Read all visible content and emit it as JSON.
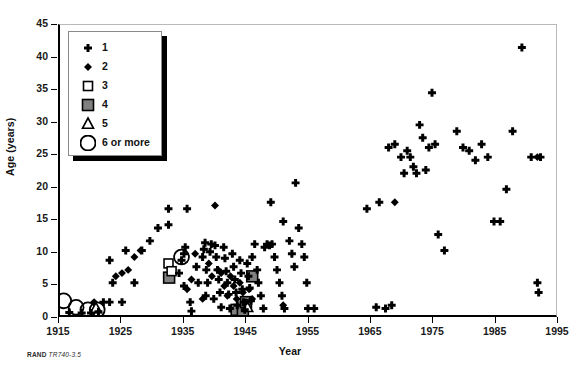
{
  "caption": {
    "brand": "RAND",
    "code": "TR740-3.5"
  },
  "legend": {
    "title": "",
    "items": [
      {
        "label": "1",
        "marker": "plus-icon"
      },
      {
        "label": "2",
        "marker": "filled-diamond-icon"
      },
      {
        "label": "3",
        "marker": "open-square-icon"
      },
      {
        "label": "4",
        "marker": "gray-square-icon"
      },
      {
        "label": "5",
        "marker": "open-triangle-icon"
      },
      {
        "label": "6 or more",
        "marker": "open-circle-icon"
      }
    ]
  },
  "colors": {
    "marker_black": "#000000",
    "gray_fill": "#808080",
    "axis": "#000000",
    "frame": "#b9b9b9",
    "background": "#ffffff"
  },
  "chart_data": {
    "type": "scatter",
    "title": "",
    "subtitle": "",
    "xlabel": "Year",
    "ylabel": "Age (years)",
    "xlim": [
      1915,
      1995
    ],
    "ylim": [
      0,
      45
    ],
    "xticks": [
      1915,
      1925,
      1935,
      1945,
      1955,
      1965,
      1975,
      1985,
      1995
    ],
    "yticks": [
      0,
      5,
      10,
      15,
      20,
      25,
      30,
      35,
      40,
      45
    ],
    "xtick_labels": [
      "1915",
      "1925",
      "1935",
      "1945",
      "1955",
      "1965",
      "1975",
      "1985",
      "1995"
    ],
    "ytick_labels": [
      "0",
      "5",
      "10",
      "15",
      "20",
      "25",
      "30",
      "35",
      "40",
      "45"
    ],
    "grid": false,
    "legend_position": "upper-left",
    "legend_title": "",
    "series": [
      {
        "name": "1",
        "marker": "plus",
        "count_represented": 1,
        "points": [
          [
            1916.5,
            0.4
          ],
          [
            1918.5,
            0.3
          ],
          [
            1920.0,
            0.3
          ],
          [
            1921.2,
            0.5
          ],
          [
            1922.0,
            2.0
          ],
          [
            1923.0,
            2.0
          ],
          [
            1925.0,
            2.0
          ],
          [
            1923.5,
            5.0
          ],
          [
            1927.0,
            5.0
          ],
          [
            1923.0,
            8.5
          ],
          [
            1925.6,
            10.0
          ],
          [
            1928.2,
            10.0
          ],
          [
            1929.5,
            11.5
          ],
          [
            1930.8,
            13.5
          ],
          [
            1932.5,
            16.5
          ],
          [
            1935.5,
            16.5
          ],
          [
            1932.5,
            14.0
          ],
          [
            1934.6,
            8.5
          ],
          [
            1935.0,
            9.5
          ],
          [
            1935.2,
            10.5
          ],
          [
            1934.2,
            6.5
          ],
          [
            1935.0,
            4.5
          ],
          [
            1936.0,
            2.0
          ],
          [
            1936.2,
            0.6
          ],
          [
            1937.0,
            7.5
          ],
          [
            1937.3,
            5.0
          ],
          [
            1938.0,
            9.0
          ],
          [
            1938.2,
            10.2
          ],
          [
            1938.4,
            11.2
          ],
          [
            1938.6,
            7.0
          ],
          [
            1938.8,
            5.0
          ],
          [
            1938.5,
            3.0
          ],
          [
            1939.2,
            9.8
          ],
          [
            1939.4,
            11.0
          ],
          [
            1939.8,
            2.5
          ],
          [
            1940.0,
            10.8
          ],
          [
            1940.2,
            9.0
          ],
          [
            1940.4,
            7.0
          ],
          [
            1940.6,
            5.5
          ],
          [
            1940.8,
            3.5
          ],
          [
            1941.0,
            1.2
          ],
          [
            1941.4,
            10.5
          ],
          [
            1941.6,
            8.8
          ],
          [
            1941.8,
            6.8
          ],
          [
            1942.0,
            5.0
          ],
          [
            1942.2,
            3.2
          ],
          [
            1942.4,
            1.0
          ],
          [
            1942.8,
            9.5
          ],
          [
            1943.0,
            7.5
          ],
          [
            1943.2,
            5.5
          ],
          [
            1943.4,
            3.5
          ],
          [
            1943.6,
            1.5
          ],
          [
            1944.0,
            8.5
          ],
          [
            1944.2,
            6.5
          ],
          [
            1944.4,
            4.0
          ],
          [
            1944.6,
            2.0
          ],
          [
            1944.8,
            0.8
          ],
          [
            1945.2,
            8.0
          ],
          [
            1945.4,
            6.0
          ],
          [
            1945.6,
            4.2
          ],
          [
            1945.8,
            2.2
          ],
          [
            1946.0,
            9.0
          ],
          [
            1946.4,
            11.0
          ],
          [
            1946.8,
            7.0
          ],
          [
            1947.0,
            5.0
          ],
          [
            1947.4,
            3.0
          ],
          [
            1947.8,
            1.0
          ],
          [
            1948.0,
            10.5
          ],
          [
            1948.4,
            11.0
          ],
          [
            1948.8,
            10.8
          ],
          [
            1949.2,
            11.0
          ],
          [
            1949.6,
            9.0
          ],
          [
            1950.0,
            7.0
          ],
          [
            1950.4,
            5.0
          ],
          [
            1950.8,
            3.0
          ],
          [
            1951.2,
            1.0
          ],
          [
            1949.0,
            17.5
          ],
          [
            1951.0,
            14.5
          ],
          [
            1952.0,
            11.5
          ],
          [
            1952.4,
            9.5
          ],
          [
            1952.8,
            7.5
          ],
          [
            1953.0,
            20.5
          ],
          [
            1953.5,
            13.5
          ],
          [
            1954.0,
            11.0
          ],
          [
            1954.4,
            9.0
          ],
          [
            1954.8,
            5.0
          ],
          [
            1955.0,
            1.0
          ],
          [
            1956.0,
            1.0
          ],
          [
            1966.0,
            1.2
          ],
          [
            1967.5,
            1.0
          ],
          [
            1968.5,
            1.5
          ],
          [
            1964.5,
            16.5
          ],
          [
            1966.5,
            17.5
          ],
          [
            1968.0,
            26.0
          ],
          [
            1969.0,
            26.5
          ],
          [
            1970.0,
            24.5
          ],
          [
            1970.5,
            22.0
          ],
          [
            1971.0,
            25.5
          ],
          [
            1971.5,
            24.5
          ],
          [
            1972.0,
            23.0
          ],
          [
            1972.5,
            22.0
          ],
          [
            1973.0,
            29.5
          ],
          [
            1973.5,
            27.5
          ],
          [
            1974.0,
            22.5
          ],
          [
            1974.5,
            26.0
          ],
          [
            1975.0,
            34.5
          ],
          [
            1975.5,
            26.5
          ],
          [
            1976.0,
            12.5
          ],
          [
            1977.0,
            10.0
          ],
          [
            1979.0,
            28.5
          ],
          [
            1980.0,
            26.0
          ],
          [
            1981.0,
            25.5
          ],
          [
            1982.0,
            24.0
          ],
          [
            1983.0,
            26.5
          ],
          [
            1984.0,
            24.5
          ],
          [
            1985.0,
            14.5
          ],
          [
            1986.0,
            14.5
          ],
          [
            1987.0,
            19.5
          ],
          [
            1988.0,
            28.5
          ],
          [
            1989.5,
            41.5
          ],
          [
            1991.0,
            24.5
          ],
          [
            1992.5,
            24.5
          ],
          [
            1992.0,
            5.0
          ],
          [
            1992.2,
            3.5
          ]
        ]
      },
      {
        "name": "2",
        "marker": "filled-diamond",
        "count_represented": 2,
        "points": [
          [
            1920.5,
            2.0
          ],
          [
            1924.0,
            6.0
          ],
          [
            1925.0,
            6.5
          ],
          [
            1926.0,
            7.0
          ],
          [
            1927.0,
            9.0
          ],
          [
            1928.0,
            10.0
          ],
          [
            1935.5,
            4.0
          ],
          [
            1936.2,
            5.5
          ],
          [
            1936.8,
            9.5
          ],
          [
            1938.0,
            2.5
          ],
          [
            1939.0,
            8.0
          ],
          [
            1939.5,
            6.0
          ],
          [
            1940.0,
            17.0
          ],
          [
            1940.5,
            7.0
          ],
          [
            1941.0,
            6.5
          ],
          [
            1941.5,
            4.5
          ],
          [
            1942.0,
            3.0
          ],
          [
            1942.5,
            6.0
          ],
          [
            1943.0,
            4.5
          ],
          [
            1943.5,
            2.5
          ],
          [
            1944.0,
            5.0
          ],
          [
            1944.5,
            3.5
          ],
          [
            1945.0,
            2.0
          ],
          [
            1945.5,
            4.0
          ],
          [
            1946.0,
            2.5
          ],
          [
            1951.0,
            1.5
          ],
          [
            1969.0,
            17.5
          ],
          [
            1992.0,
            24.5
          ]
        ]
      },
      {
        "name": "3",
        "marker": "open-square",
        "count_represented": 3,
        "points": [
          [
            1932.5,
            8.0
          ],
          [
            1933.0,
            6.8
          ]
        ]
      },
      {
        "name": "4",
        "marker": "gray-square",
        "count_represented": 4,
        "points": [
          [
            1932.6,
            5.8
          ],
          [
            1946.0,
            6.0
          ],
          [
            1943.5,
            0.8
          ],
          [
            1944.5,
            0.6
          ],
          [
            1945.0,
            2.0
          ]
        ]
      },
      {
        "name": "5",
        "marker": "open-triangle",
        "count_represented": 5,
        "points": [
          [
            1920.8,
            1.0
          ],
          [
            1945.2,
            1.2
          ]
        ]
      },
      {
        "name": "6 or more",
        "marker": "open-circle",
        "count_represented": 6,
        "points": [
          [
            1915.6,
            2.2
          ],
          [
            1917.6,
            1.2
          ],
          [
            1919.5,
            0.8
          ],
          [
            1921.0,
            0.8
          ],
          [
            1934.6,
            9.0
          ]
        ]
      }
    ]
  }
}
